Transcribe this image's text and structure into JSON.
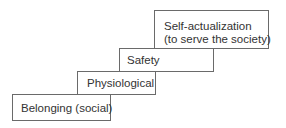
{
  "diagram": {
    "title": "",
    "steps": [
      {
        "label": "Belonging (social)",
        "lines": [
          "Belonging (social)"
        ]
      },
      {
        "label": "Physiological",
        "lines": [
          "Physiological"
        ]
      },
      {
        "label": "Safety",
        "lines": [
          "Safety"
        ]
      },
      {
        "label": "Self-actualization (to serve the society)",
        "lines": [
          "Self-actualization",
          "(to serve the society)"
        ]
      }
    ]
  }
}
